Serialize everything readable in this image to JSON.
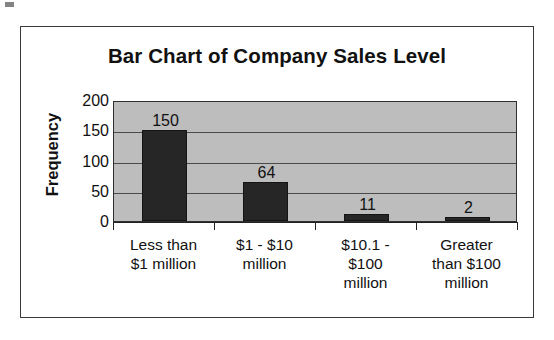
{
  "figure": {
    "title": "Bar Chart of Company Sales Level",
    "background_color": "#ffffff",
    "plot_background_color": "#bdbdbd",
    "bar_color": "#262626",
    "border_color": "#3a3a3a"
  },
  "chart_data": {
    "type": "bar",
    "title": "Bar Chart of Company Sales Level",
    "xlabel": "",
    "ylabel": "Frequency",
    "categories": [
      "Less than $1 million",
      "$1 - $10 million",
      "$10.1 - $100 million",
      "Greater than $100 million"
    ],
    "category_lines": [
      [
        "Less than",
        "$1 million"
      ],
      [
        "$1 - $10",
        "million"
      ],
      [
        "$10.1 -",
        "$100",
        "million"
      ],
      [
        "Greater",
        "than $100",
        "million"
      ]
    ],
    "values": [
      150,
      64,
      11,
      2
    ],
    "value_labels": [
      "150",
      "64",
      "11",
      "2"
    ],
    "ylim": [
      0,
      200
    ],
    "yticks": [
      200,
      150,
      100,
      50,
      0
    ],
    "ytick_labels": [
      "200",
      "150",
      "100",
      "50",
      "0"
    ],
    "grid": true,
    "grid_axis": "y",
    "legend": false
  }
}
